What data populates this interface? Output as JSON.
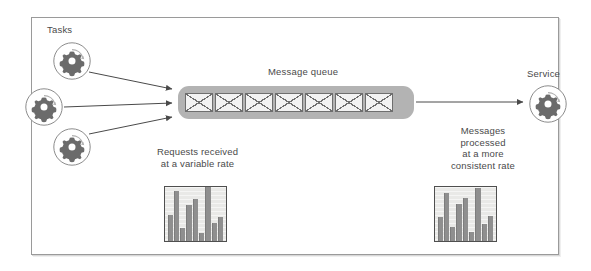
{
  "diagram": {
    "frame": {
      "border_color": "#9a9a9a"
    }
  },
  "labels": {
    "tasks": "Tasks",
    "message_queue": "Message queue",
    "service": "Service"
  },
  "captions": {
    "left": "Requests received\nat a variable rate",
    "left_line1": "Requests received",
    "left_line2": "at a variable rate",
    "right_line1": "Messages",
    "right_line2": "processed",
    "right_line3": "at a more",
    "right_line4": "consistent rate"
  },
  "tasks": [
    {
      "name": "task-1",
      "icon": "gear-icon"
    },
    {
      "name": "task-2",
      "icon": "gear-icon"
    },
    {
      "name": "task-3",
      "icon": "gear-icon"
    }
  ],
  "service": {
    "name": "service",
    "icon": "gear-icon"
  },
  "queue": {
    "icon": "envelope-icon",
    "count": 7,
    "fill_color": "#b3b3b3",
    "message_color": "#f2f2f2"
  },
  "arrows": [
    {
      "name": "task-1-to-queue",
      "from": "task-1",
      "to": "message-queue"
    },
    {
      "name": "task-2-to-queue",
      "from": "task-2",
      "to": "message-queue"
    },
    {
      "name": "task-3-to-queue",
      "from": "task-3",
      "to": "message-queue"
    },
    {
      "name": "queue-to-service",
      "from": "message-queue",
      "to": "service"
    }
  ],
  "chart_data": [
    {
      "type": "bar",
      "name": "requests-received-chart",
      "title": "Requests received at a variable rate",
      "categories": [
        "1",
        "2",
        "3",
        "4",
        "5",
        "6",
        "7",
        "8"
      ],
      "values": [
        48,
        92,
        24,
        66,
        78,
        14,
        100,
        34,
        44
      ],
      "ylim": [
        0,
        100
      ],
      "xlabel": "",
      "ylabel": "",
      "grid": true,
      "bar_color": "#8f8f8f",
      "background": "#e9e9e7"
    },
    {
      "type": "bar",
      "name": "messages-processed-chart",
      "title": "Messages processed at a more consistent rate",
      "categories": [
        "1",
        "2",
        "3",
        "4",
        "5",
        "6",
        "7",
        "8"
      ],
      "values": [
        44,
        88,
        26,
        68,
        80,
        16,
        98,
        32,
        46
      ],
      "ylim": [
        0,
        100
      ],
      "xlabel": "",
      "ylabel": "",
      "grid": true,
      "bar_color": "#8f8f8f",
      "background": "#e9e9e7"
    }
  ]
}
